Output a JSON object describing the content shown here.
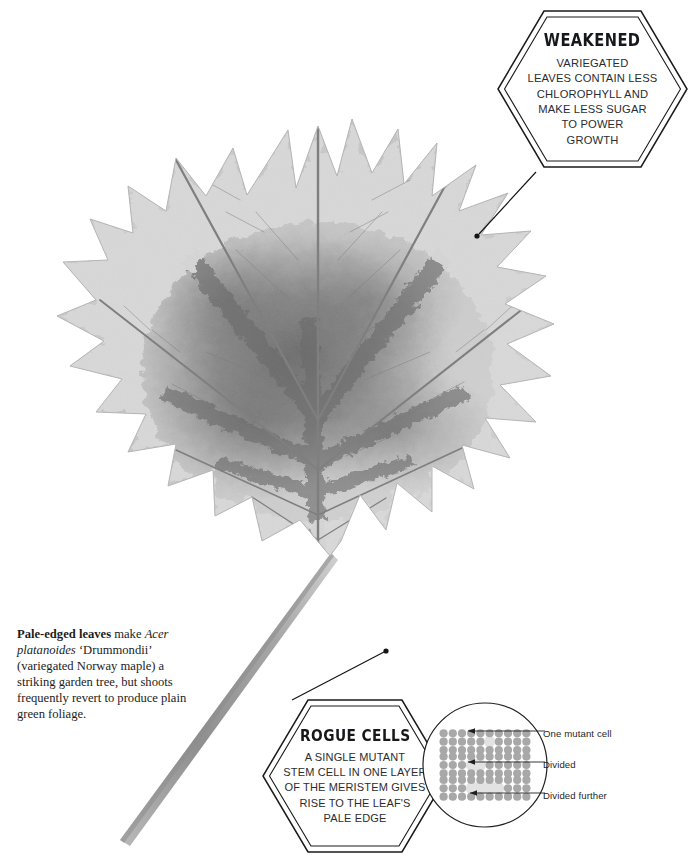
{
  "page": {
    "width": 696,
    "height": 858,
    "background_color": "#ffffff",
    "ink_color": "#1b1b1b"
  },
  "figure": {
    "alt": "Grayscale x-ray style photograph of a variegated Acer platanoides 'Drummondii' maple leaf with a dark mottled centre and pale edges, shown with its stalk running to the lower left"
  },
  "callouts": [
    {
      "id": "weakened",
      "title": "WEAKENED",
      "lines": [
        "VARIEGATED",
        "LEAVES CONTAIN LESS",
        "CHLOROPHYLL AND",
        "MAKE LESS SUGAR",
        "TO POWER",
        "GROWTH"
      ]
    },
    {
      "id": "rogue-cells",
      "title": "ROGUE CELLS",
      "lines": [
        "A SINGLE MUTANT",
        "STEM CELL IN ONE LAYER",
        "OF THE MERISTEM GIVES",
        "RISE TO THE LEAF'S",
        "PALE EDGE"
      ]
    }
  ],
  "caption": {
    "lead": "Pale-edged leaves",
    "after_lead": " make",
    "species": "Acer platanoides",
    "cultivar": " ‘Drummondii’",
    "rest": "(variegated Norway maple) a striking garden tree, but shoots frequently revert to produce plain green foliage."
  },
  "cell_diagram": {
    "title": "mutant cell division stages",
    "cell_color": "#a8a8a8",
    "mutant_color": "#e2e2e2",
    "circle_stroke": "#1f1f1f",
    "rows_per_group": 3,
    "cells_per_row": 10,
    "groups": [
      {
        "label": "One mutant cell",
        "mutant_start": 5,
        "mutant_count": 1,
        "mutant_row": 1
      },
      {
        "label": "Divided",
        "mutant_start": 3,
        "mutant_count": 2,
        "mutant_row": 1
      },
      {
        "label": "Divided further",
        "mutant_start": 3,
        "mutant_count": 4,
        "mutant_row": 1
      }
    ],
    "legend": [
      "One mutant cell",
      "Divided",
      "Divided further"
    ]
  }
}
